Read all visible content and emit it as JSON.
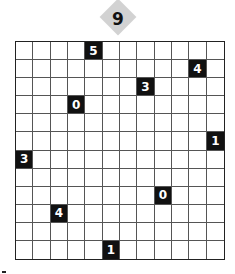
{
  "puzzle": {
    "number": "9",
    "rows": 12,
    "cols": 12,
    "clues": [
      {
        "row": 0,
        "col": 4,
        "value": "5"
      },
      {
        "row": 1,
        "col": 10,
        "value": "4"
      },
      {
        "row": 2,
        "col": 7,
        "value": "3"
      },
      {
        "row": 3,
        "col": 3,
        "value": "0"
      },
      {
        "row": 5,
        "col": 11,
        "value": "1"
      },
      {
        "row": 6,
        "col": 0,
        "value": "3"
      },
      {
        "row": 8,
        "col": 8,
        "value": "0"
      },
      {
        "row": 9,
        "col": 2,
        "value": "4"
      },
      {
        "row": 11,
        "col": 5,
        "value": "1"
      }
    ]
  },
  "colors": {
    "clue_bg": "#111111",
    "badge_bg": "#d2d2d2"
  }
}
